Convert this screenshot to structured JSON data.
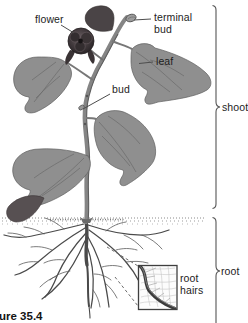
{
  "figure_caption": "ure 35.4",
  "labels": {
    "flower": "flower",
    "terminal_bud_line1": "terminal",
    "terminal_bud_line2": "bud",
    "leaf": "leaf",
    "bud": "bud",
    "shoot": "shoot",
    "root": "root",
    "root_hairs_line1": "root",
    "root_hairs_line2": "hairs"
  },
  "colors": {
    "background": "#ffffff",
    "label_text": "#1d1d1d",
    "leader_line": "#4d4d4d",
    "brace": "#565656",
    "leaf_fill": "#8f8f8f",
    "flower_dark": "#3a3335",
    "stem_gray": "#858585",
    "root_stroke": "#4a4a4a"
  }
}
